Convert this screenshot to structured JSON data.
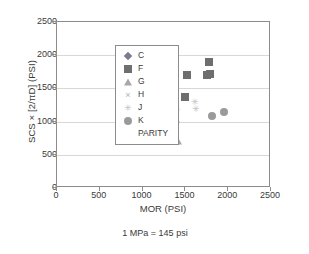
{
  "chart_data": {
    "type": "scatter",
    "title": "",
    "xlabel": "MOR (PSI)",
    "ylabel": "SCS × [2/πD] (PSI)",
    "caption": "1 MPa = 145 psi",
    "xlim": [
      0,
      2500
    ],
    "ylim": [
      0,
      2500
    ],
    "xticks": [
      0,
      500,
      1000,
      1500,
      2000,
      2500
    ],
    "yticks": [
      0,
      500,
      1000,
      1500,
      2000,
      2500
    ],
    "xtick_labels": [
      "0",
      "500",
      "1000",
      "1500",
      "2000",
      "2500"
    ],
    "ytick_labels": [
      "0",
      "500",
      "1000",
      "1500",
      "2000",
      "2500"
    ],
    "grid": "horizontal",
    "legend_position": "upper-left-inside",
    "series": [
      {
        "name": "C",
        "marker": "diamond",
        "color": "#7b7b8c",
        "points": []
      },
      {
        "name": "F",
        "marker": "square",
        "color": "#6e6e6e",
        "points": [
          {
            "x": 1520,
            "y": 1700
          },
          {
            "x": 1500,
            "y": 1375
          },
          {
            "x": 1770,
            "y": 1900
          },
          {
            "x": 1790,
            "y": 1715
          },
          {
            "x": 1750,
            "y": 1700
          }
        ]
      },
      {
        "name": "G",
        "marker": "triangle",
        "color": "#a8a8a8",
        "points": [
          {
            "x": 1270,
            "y": 1130
          },
          {
            "x": 1390,
            "y": 1045
          },
          {
            "x": 1330,
            "y": 720
          },
          {
            "x": 1410,
            "y": 715
          }
        ]
      },
      {
        "name": "H",
        "marker": "x",
        "color": "#b0b0b0",
        "points": [
          {
            "x": 840,
            "y": 1150
          },
          {
            "x": 1320,
            "y": 1190
          },
          {
            "x": 1390,
            "y": 1570
          }
        ]
      },
      {
        "name": "J",
        "marker": "star",
        "color": "#c0c0c0",
        "points": [
          {
            "x": 1400,
            "y": 1180
          },
          {
            "x": 1610,
            "y": 1290
          },
          {
            "x": 1620,
            "y": 1195
          }
        ]
      },
      {
        "name": "K",
        "marker": "circle",
        "color": "#9a9a9a",
        "points": [
          {
            "x": 1810,
            "y": 1085
          },
          {
            "x": 1950,
            "y": 1150
          }
        ]
      },
      {
        "name": "PARITY",
        "marker": "none",
        "color": "#b5b5b5",
        "points": []
      }
    ]
  }
}
